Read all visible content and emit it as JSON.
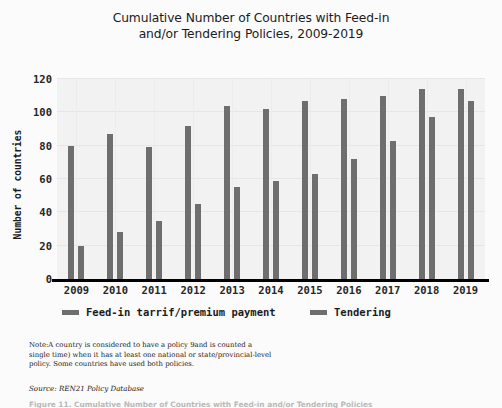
{
  "chart_data": {
    "type": "bar",
    "title": "Cumulative Number of Countries with Feed-in and/or Tendering Policies, 2009-2019",
    "title_lines": [
      "Cumulative Number of Countries with Feed-in",
      "and/or Tendering Policies, 2009-2019"
    ],
    "xlabel": "",
    "ylabel": "Number of countries",
    "categories": [
      "2009",
      "2010",
      "2011",
      "2012",
      "2013",
      "2014",
      "2015",
      "2016",
      "2017",
      "2018",
      "2019"
    ],
    "series": [
      {
        "name": "Feed-in tarrif/premium payment",
        "color": "#6e6e6e",
        "values": [
          80,
          87,
          79,
          92,
          104,
          102,
          107,
          108,
          110,
          114,
          114
        ]
      },
      {
        "name": "Tendering",
        "color": "#6e6e6e",
        "values": [
          20,
          28,
          35,
          45,
          55,
          59,
          63,
          72,
          83,
          97,
          107
        ]
      }
    ],
    "ylim": [
      0,
      120
    ],
    "yticks": [
      0,
      20,
      40,
      60,
      80,
      100,
      120
    ],
    "ytick_labels": [
      "0",
      "20",
      "40",
      "60",
      "80",
      "100",
      "120"
    ],
    "grid": true,
    "grid_axis": "both",
    "legend_position": "below-axes",
    "plot_background": "#f2f2f2",
    "figure_background": "#fbfbfb",
    "axis_color": "#000000"
  },
  "legend": {
    "entries": [
      {
        "label": "Feed-in tarrif/premium payment",
        "swatch_color": "#6e6e6e"
      },
      {
        "label": "Tendering",
        "swatch_color": "#6e6e6e"
      }
    ]
  },
  "annotations": {
    "note_lines": [
      "Note:A country is considered to have a policy 9and is counted a",
      "single time) when it has at least one national or state/provincial-level",
      "policy. Some countries have used both policies."
    ],
    "source": "Source: REN21 Policy Database",
    "caption": "Figure 11. Cumulative Number of Countries with Feed-in and/or Tendering Policies"
  }
}
